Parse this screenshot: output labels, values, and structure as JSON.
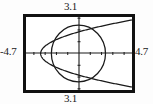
{
  "figure": {
    "kind": "graphing-calculator-screen",
    "background_color": "#fdfdfd",
    "ink_color": "#1a1a1a"
  },
  "window_labels": {
    "top": "3.1",
    "bottom": "3.1",
    "left": "-4.7",
    "right": "4.7"
  },
  "chart_data": {
    "type": "line",
    "title": "",
    "xlabel": "",
    "ylabel": "",
    "xlim": [
      -4.7,
      4.7
    ],
    "ylim": [
      -3.1,
      3.1
    ],
    "grid": false,
    "legend": "none",
    "axes": {
      "x_axis_visible": true,
      "y_axis_visible": true,
      "x_tick_spacing": 1,
      "y_tick_spacing": 1,
      "x_ticks": [
        -4,
        -3,
        -2,
        -1,
        1,
        2,
        3,
        4
      ],
      "y_ticks": [
        -3,
        -2,
        -1,
        1,
        2,
        3
      ],
      "tick_mark_length_px": 3
    },
    "frame": {
      "visible": true,
      "border_width_px": 3,
      "color": "#111111"
    },
    "series": [
      {
        "name": "parabola",
        "shape": "leftward-opening parabola",
        "equation": "x = y^2 - 3.4",
        "vertex": [
          -3.4,
          0
        ],
        "x": [
          -3.4,
          -3.0,
          -2.4,
          -1.4,
          0.0,
          1.6,
          3.0,
          4.4,
          4.7
        ],
        "y_upper": [
          0.0,
          0.63,
          1.0,
          1.41,
          1.84,
          2.24,
          2.53,
          2.79,
          2.85
        ],
        "y_lower": [
          0.0,
          -0.63,
          -1.0,
          -1.41,
          -1.84,
          -2.24,
          -2.53,
          -2.79,
          -2.85
        ]
      },
      {
        "name": "circle",
        "shape": "circle",
        "equation": "x^2 + y^2 = 2.4^2",
        "center": [
          -0.05,
          0.0
        ],
        "radius": 2.4
      }
    ]
  }
}
